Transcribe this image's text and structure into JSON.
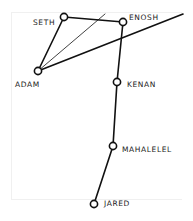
{
  "diagram": {
    "nodes": [
      {
        "id": "seth",
        "label": "SETH",
        "x": 64,
        "y": 17
      },
      {
        "id": "enosh",
        "label": "ENOSH",
        "x": 123,
        "y": 22
      },
      {
        "id": "adam",
        "label": "ADAM",
        "x": 38,
        "y": 71
      },
      {
        "id": "kenan",
        "label": "KENAN",
        "x": 117,
        "y": 82
      },
      {
        "id": "mahalelel",
        "label": "MAHALELEL",
        "x": 113,
        "y": 146
      },
      {
        "id": "jared",
        "label": "JARED",
        "x": 94,
        "y": 204
      }
    ],
    "edges": [
      [
        "adam",
        "seth"
      ],
      [
        "seth",
        "enosh"
      ],
      [
        "enosh",
        "kenan"
      ],
      [
        "kenan",
        "mahalelel"
      ],
      [
        "mahalelel",
        "jared"
      ]
    ],
    "rays": [
      {
        "from": "adam",
        "to_x": 105,
        "to_y": 14,
        "weight": "thin"
      },
      {
        "from": "adam",
        "to_x": 183,
        "to_y": 14,
        "weight": "thick"
      }
    ]
  }
}
